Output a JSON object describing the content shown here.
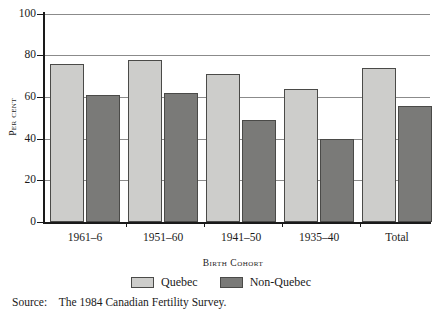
{
  "chart_data": {
    "type": "bar",
    "title": "",
    "xlabel": "Birth Cohort",
    "ylabel": "Per cent",
    "categories": [
      "1961–6",
      "1951–60",
      "1941–50",
      "1935–40",
      "Total"
    ],
    "series": [
      {
        "name": "Quebec",
        "color": "#cdcdcb",
        "values": [
          76,
          78,
          71,
          64,
          74
        ]
      },
      {
        "name": "Non-Quebec",
        "color": "#7a7a78",
        "values": [
          61,
          62,
          49,
          40,
          56
        ]
      }
    ],
    "ylim": [
      0,
      100
    ],
    "yticks": [
      0,
      20,
      40,
      60,
      80,
      100
    ],
    "ytick_labels": [
      "0",
      "20",
      "40",
      "60",
      "80",
      "100"
    ],
    "grid": true,
    "grid_axis": "y",
    "legend_position": "bottom"
  },
  "axis": {
    "y_title": "Per cent",
    "x_title": "Birth Cohort"
  },
  "legend": {
    "items": [
      {
        "label": "Quebec"
      },
      {
        "label": "Non-Quebec"
      }
    ]
  },
  "source": {
    "label": "Source:",
    "text": "The 1984 Canadian Fertility Survey."
  }
}
